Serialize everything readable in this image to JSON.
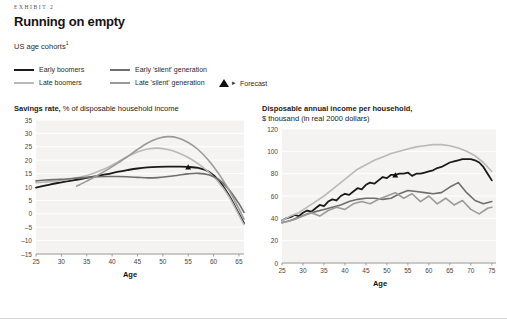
{
  "exhibit_label": "EXHIBIT 2",
  "title": "Running on empty",
  "subtitle": "US age cohorts",
  "subtitle_footnote_marker": "1",
  "legend": {
    "items": [
      {
        "label": "Early boomers",
        "color": "#1a1a1a"
      },
      {
        "label": "Late boomers",
        "color": "#b9b9b9"
      },
      {
        "label": "Early 'silent' generation",
        "color": "#6e6e6e"
      },
      {
        "label": "Late 'silent' generation",
        "color": "#9a9a9a"
      }
    ],
    "forecast_label": "Forecast",
    "forecast_marker": "triangle-marker",
    "forecast_arrow": "▸"
  },
  "chart_data": [
    {
      "type": "line",
      "title": "Savings rate,",
      "subtitle": "% of disposable household income",
      "xlabel": "Age",
      "ylabel": "",
      "xlim": [
        25,
        66
      ],
      "ylim": [
        -15,
        35
      ],
      "xticks": [
        25,
        30,
        35,
        40,
        45,
        50,
        55,
        60,
        65
      ],
      "yticks": [
        -15,
        -10,
        -5,
        0,
        5,
        10,
        15,
        20,
        25,
        30,
        35
      ],
      "grid": true,
      "legend_position": "top",
      "forecast_point": {
        "x": 55,
        "y": 17.5
      },
      "series": [
        {
          "name": "Early boomers",
          "color": "#1a1a1a",
          "width": 1.8,
          "x": [
            25,
            27,
            29,
            31,
            33,
            35,
            37,
            39,
            41,
            43,
            45,
            47,
            49,
            51,
            53,
            55,
            57,
            59,
            61,
            63,
            65,
            66
          ],
          "y": [
            9.8,
            10.6,
            11.4,
            12.1,
            12.7,
            13.4,
            14.1,
            14.8,
            15.6,
            16.3,
            16.9,
            17.3,
            17.5,
            17.6,
            17.6,
            17.5,
            17.1,
            15.8,
            12.5,
            7.0,
            0.0,
            -3.5
          ]
        },
        {
          "name": "Late boomers",
          "color": "#b9b9b9",
          "width": 1.6,
          "x": [
            25,
            27,
            29,
            31,
            33,
            35,
            37,
            39,
            41,
            43,
            45,
            47,
            49,
            51,
            53,
            55,
            57,
            59,
            61,
            63,
            65,
            66
          ],
          "y": [
            11.6,
            11.9,
            12.2,
            12.7,
            13.4,
            14.3,
            15.6,
            17.2,
            19.2,
            21.3,
            23.1,
            24.2,
            24.5,
            24.0,
            22.8,
            21.0,
            18.6,
            15.6,
            11.8,
            6.5,
            -0.5,
            -4.0
          ]
        },
        {
          "name": "Early 'silent' generation",
          "color": "#6e6e6e",
          "width": 1.6,
          "x": [
            25,
            27,
            29,
            31,
            33,
            35,
            37,
            39,
            41,
            43,
            45,
            47,
            49,
            51,
            53,
            55,
            57,
            59,
            61,
            63,
            65,
            66
          ],
          "y": [
            12.3,
            12.6,
            12.8,
            13.0,
            13.3,
            13.6,
            13.8,
            13.9,
            13.9,
            13.8,
            13.6,
            13.4,
            13.5,
            13.9,
            14.4,
            14.9,
            15.1,
            14.6,
            12.8,
            9.2,
            3.8,
            0.5
          ]
        },
        {
          "name": "Late 'silent' generation",
          "color": "#9a9a9a",
          "width": 1.6,
          "x": [
            33,
            35,
            37,
            39,
            41,
            43,
            45,
            47,
            49,
            51,
            53,
            55,
            57,
            59,
            61,
            63,
            65,
            66
          ],
          "y": [
            10.3,
            12.2,
            14.2,
            16.4,
            18.8,
            21.3,
            24.0,
            26.4,
            28.1,
            28.8,
            28.3,
            26.6,
            23.9,
            20.0,
            15.0,
            9.0,
            1.8,
            -2.0
          ]
        }
      ]
    },
    {
      "type": "line",
      "title": "Disposable annual income per household,",
      "subtitle": "$ thousand (in real 2000 dollars)",
      "xlabel": "Age",
      "ylabel": "",
      "xlim": [
        25,
        76
      ],
      "ylim": [
        0,
        120
      ],
      "xticks": [
        25,
        30,
        35,
        40,
        45,
        50,
        55,
        60,
        65,
        70,
        75
      ],
      "yticks": [
        0,
        20,
        40,
        60,
        80,
        100,
        120
      ],
      "grid": true,
      "legend_position": "top",
      "forecast_point": {
        "x": 52,
        "y": 79
      },
      "series": [
        {
          "name": "Early boomers",
          "color": "#1a1a1a",
          "width": 1.8,
          "x": [
            25,
            26,
            27,
            28,
            29,
            30,
            31,
            32,
            33,
            34,
            35,
            36,
            37,
            38,
            39,
            40,
            41,
            42,
            43,
            44,
            45,
            46,
            47,
            48,
            49,
            50,
            51,
            52,
            53,
            54,
            55,
            56,
            57,
            58,
            59,
            60,
            61,
            62,
            63,
            64,
            65,
            66,
            67,
            68,
            69,
            70,
            71,
            72,
            73,
            74,
            75
          ],
          "y": [
            38,
            40,
            41,
            43,
            42,
            45,
            47,
            46,
            49,
            52,
            51,
            55,
            57,
            56,
            60,
            62,
            61,
            64,
            67,
            66,
            70,
            72,
            71,
            74,
            77,
            76,
            79,
            79,
            80,
            80,
            81,
            78,
            80,
            80,
            81,
            82,
            83,
            85,
            86,
            88,
            90,
            91,
            92,
            93,
            93,
            93,
            92,
            90,
            86,
            80,
            74
          ]
        },
        {
          "name": "Late boomers",
          "color": "#b9b9b9",
          "width": 1.6,
          "x": [
            25,
            27,
            29,
            31,
            33,
            35,
            37,
            39,
            41,
            43,
            45,
            47,
            49,
            51,
            53,
            55,
            57,
            59,
            61,
            63,
            65,
            67,
            69,
            71,
            73,
            75
          ],
          "y": [
            38,
            42,
            45,
            50,
            55,
            60,
            66,
            72,
            78,
            84,
            88,
            92,
            95,
            98,
            100,
            102,
            104,
            105,
            106,
            106,
            105,
            103,
            100,
            96,
            90,
            82
          ]
        },
        {
          "name": "Early 'silent' generation",
          "color": "#6e6e6e",
          "width": 1.6,
          "x": [
            25,
            27,
            29,
            31,
            33,
            35,
            37,
            39,
            41,
            43,
            45,
            47,
            49,
            51,
            53,
            55,
            57,
            59,
            61,
            63,
            65,
            67,
            69,
            71,
            73,
            75
          ],
          "y": [
            36,
            38,
            41,
            44,
            46,
            48,
            50,
            52,
            55,
            57,
            58,
            58,
            57,
            58,
            62,
            65,
            64,
            63,
            62,
            63,
            68,
            72,
            63,
            56,
            53,
            55
          ]
        },
        {
          "name": "Late 'silent' generation",
          "color": "#9a9a9a",
          "width": 1.6,
          "x": [
            25,
            26,
            28,
            30,
            32,
            34,
            36,
            38,
            40,
            42,
            44,
            46,
            48,
            50,
            52,
            54,
            56,
            58,
            60,
            62,
            64,
            66,
            68,
            70,
            72,
            74,
            75
          ],
          "y": [
            36,
            37,
            39,
            42,
            45,
            42,
            47,
            50,
            48,
            53,
            55,
            53,
            57,
            60,
            63,
            58,
            62,
            55,
            60,
            53,
            58,
            52,
            56,
            48,
            44,
            49,
            50
          ]
        }
      ]
    }
  ]
}
